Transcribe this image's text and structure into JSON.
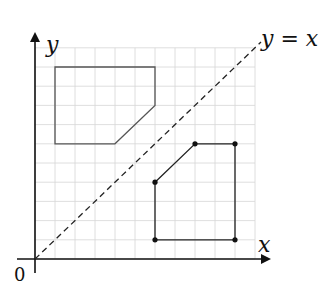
{
  "diagram": {
    "type": "coordinate-grid-reflection",
    "grid": {
      "x_range": [
        0,
        11
      ],
      "y_range": [
        0,
        11
      ],
      "step": 1
    },
    "axes": {
      "x_label": "x",
      "y_label": "y",
      "origin_label": "0"
    },
    "mirror_line": {
      "label": "y = x",
      "style": "dashed"
    },
    "shapes": [
      {
        "name": "original",
        "vertices": [
          [
            6,
            4
          ],
          [
            8,
            6
          ],
          [
            10,
            6
          ],
          [
            10,
            1
          ],
          [
            6,
            1
          ]
        ],
        "vertex_dots": true,
        "stroke": "#222222"
      },
      {
        "name": "image",
        "vertices": [
          [
            4,
            6
          ],
          [
            6,
            8
          ],
          [
            6,
            10
          ],
          [
            1,
            10
          ],
          [
            1,
            6
          ]
        ],
        "vertex_dots": false,
        "stroke": "#555555"
      }
    ]
  }
}
